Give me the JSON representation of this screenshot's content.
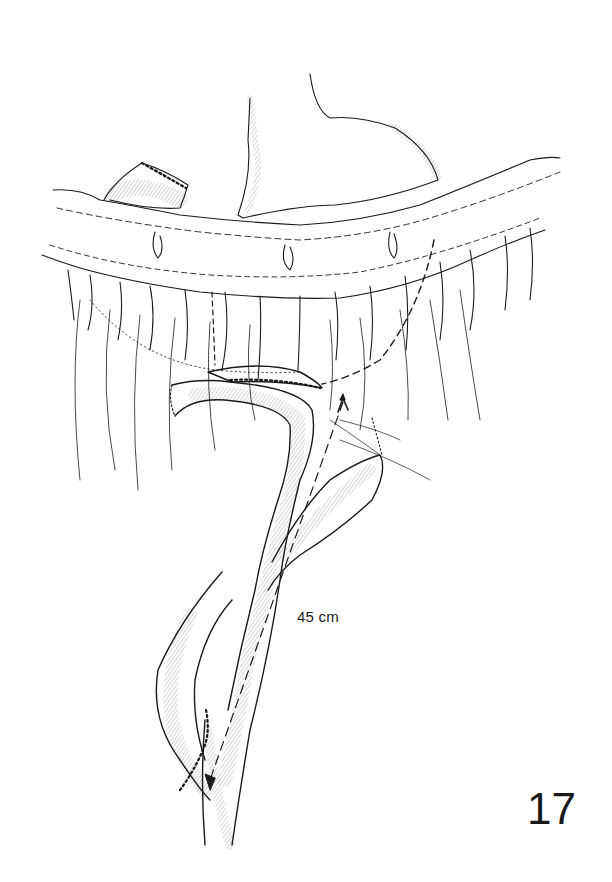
{
  "figure": {
    "number": "17",
    "annotations": {
      "length_label": "45 cm"
    },
    "structures": [
      "stomach-remnant",
      "duodenal-stump",
      "transverse-colon",
      "mesocolon",
      "gastrojejunal-anastomosis",
      "afferent-limb",
      "efferent-limb",
      "jejunojejunal-anastomosis"
    ],
    "colors": {
      "ink": "#1a1a1a",
      "background": "#ffffff"
    }
  }
}
